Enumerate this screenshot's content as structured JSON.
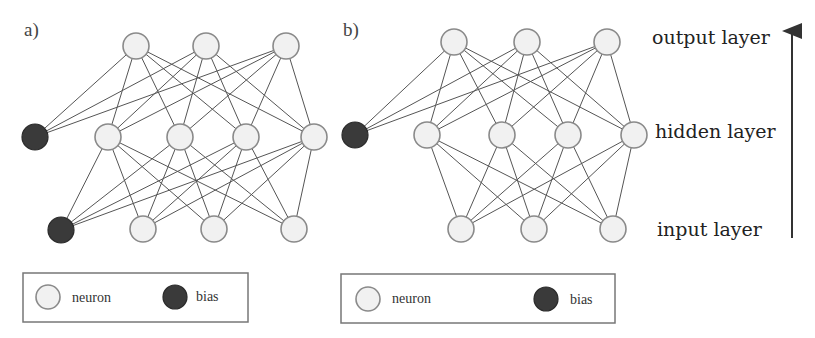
{
  "colors": {
    "neuron_fill": "#f1f1f1",
    "neuron_stroke": "#8a8a8a",
    "bias_fill": "#3a3a3a",
    "edge": "#555555",
    "text": "#222222"
  },
  "layer_labels": {
    "output": "output layer",
    "hidden": "hidden layer",
    "input": "input layer"
  },
  "panels": [
    {
      "id": "a",
      "label": "a)",
      "node_radius": 13,
      "output_nodes": [
        [
          136,
          46
        ],
        [
          206,
          46
        ],
        [
          286,
          46
        ]
      ],
      "hidden_nodes": [
        [
          108,
          137
        ],
        [
          180,
          137
        ],
        [
          246,
          137
        ],
        [
          314,
          137
        ]
      ],
      "input_nodes": [
        [
          143,
          229
        ],
        [
          214,
          229
        ],
        [
          294,
          229
        ]
      ],
      "hidden_bias": [
        35,
        137
      ],
      "input_bias": [
        61,
        230
      ],
      "legend": {
        "neuron_label": "neuron",
        "bias_label": "bias"
      }
    },
    {
      "id": "b",
      "label": "b)",
      "node_radius": 13,
      "output_nodes": [
        [
          454,
          42
        ],
        [
          527,
          42
        ],
        [
          607,
          42
        ]
      ],
      "hidden_nodes": [
        [
          427,
          135
        ],
        [
          502,
          135
        ],
        [
          568,
          135
        ],
        [
          634,
          135
        ]
      ],
      "input_nodes": [
        [
          461,
          229
        ],
        [
          534,
          229
        ],
        [
          613,
          229
        ]
      ],
      "hidden_bias": [
        355,
        135
      ],
      "input_bias": null,
      "legend": {
        "neuron_label": "neuron",
        "bias_label": "bias"
      }
    }
  ]
}
